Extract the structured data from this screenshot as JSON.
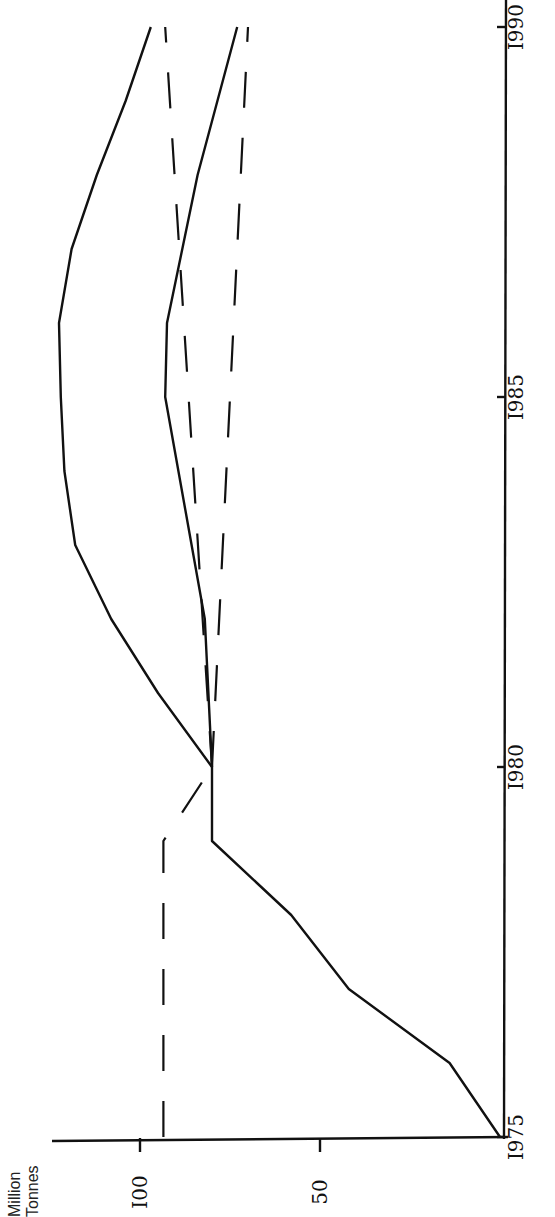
{
  "chart_data": {
    "type": "line",
    "orientation": "rotated 90° counter-clockwise (years run bottom-to-top along right edge; values increase to the left)",
    "title": "",
    "xlabel": "",
    "ylabel": "Million Tonnes",
    "ylabel_lines": [
      "Million",
      "Tonnes"
    ],
    "x_ticks": [
      "I975",
      "I980",
      "I985",
      "I990"
    ],
    "x_tick_values": [
      1975,
      1980,
      1985,
      1990
    ],
    "y_ticks": [
      "I00",
      "50"
    ],
    "y_tick_values": [
      100,
      50
    ],
    "xlim": [
      1975,
      1990
    ],
    "ylim": [
      0,
      130
    ],
    "grid": false,
    "legend": null,
    "series": [
      {
        "name": "Solid line 1 (historical, 1975-1980)",
        "style": "solid",
        "x": [
          1975,
          1976,
          1977,
          1978,
          1979,
          1980
        ],
        "values": [
          0,
          14,
          42,
          58,
          80,
          80
        ]
      },
      {
        "name": "Dashed line (1975-1980)",
        "style": "dashed",
        "x": [
          1975,
          1979,
          1980
        ],
        "values": [
          93.5,
          93.5,
          80
        ]
      },
      {
        "name": "Solid upper projection (1980-1990)",
        "style": "solid",
        "x": [
          1980,
          1981,
          1982,
          1983,
          1984,
          1985,
          1986,
          1987,
          1988,
          1989,
          1990
        ],
        "values": [
          80,
          95,
          108,
          118,
          121,
          122,
          122.5,
          119,
          112,
          104,
          97
        ]
      },
      {
        "name": "Solid lower projection (1980-1990)",
        "style": "solid",
        "x": [
          1980,
          1982,
          1985,
          1986,
          1988,
          1990
        ],
        "values": [
          80,
          82,
          93,
          92.5,
          84,
          73
        ]
      },
      {
        "name": "Dashed upper projection (1980-1990)",
        "style": "dashed",
        "x": [
          1980,
          1990
        ],
        "values": [
          80,
          93
        ]
      },
      {
        "name": "Dashed lower projection (1980-1990)",
        "style": "dashed",
        "x": [
          1980,
          1990
        ],
        "values": [
          80,
          70
        ]
      }
    ]
  },
  "layout": {
    "origin_px": [
      500,
      1137
    ],
    "px_per_unit": 3.6,
    "px_per_year": 74.0,
    "base_year": 1975,
    "value_axis_y": 1140,
    "year_axis_x": 503
  }
}
